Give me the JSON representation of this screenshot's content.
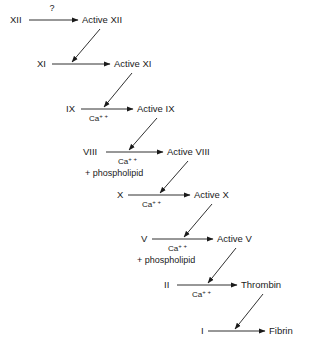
{
  "diagram": {
    "background_color": "#ffffff",
    "line_color": "#1a1a1a",
    "unknown_marker": "?",
    "cofactor_calcium": "Ca",
    "cofactor_calcium_charge": "+ +",
    "cofactor_phospholipid": "+ phospholipid",
    "steps": [
      {
        "id": "step-xii",
        "substrate": "XII",
        "product": "Active XII",
        "above_label": "?",
        "cofactor": null,
        "phospholipid": null,
        "substrate_x": 10,
        "substrate_y": 23,
        "line_x1": 29,
        "line_x2": 78,
        "product_x": 82,
        "product_y": 23,
        "line_y": 20,
        "above_label_x": 52,
        "above_label_y": 11
      },
      {
        "id": "step-xi",
        "substrate": "XI",
        "product": "Active XI",
        "above_label": null,
        "cofactor": null,
        "phospholipid": null,
        "substrate_x": 37,
        "substrate_y": 67,
        "line_x1": 52,
        "line_x2": 110,
        "product_x": 114,
        "product_y": 67,
        "line_y": 64
      },
      {
        "id": "step-ix",
        "substrate": "IX",
        "product": "Active IX",
        "above_label": null,
        "cofactor": "Ca",
        "phospholipid": null,
        "substrate_x": 66,
        "substrate_y": 112,
        "line_x1": 81,
        "line_x2": 133,
        "product_x": 137,
        "product_y": 112,
        "line_y": 109,
        "cofactor_x": 89,
        "cofactor_y": 121
      },
      {
        "id": "step-viii",
        "substrate": "VIII",
        "product": "Active VIII",
        "above_label": null,
        "cofactor": "Ca",
        "phospholipid": "+ phospholipid",
        "substrate_x": 83,
        "substrate_y": 155,
        "line_x1": 106,
        "line_x2": 163,
        "product_x": 167,
        "product_y": 155,
        "line_y": 152,
        "cofactor_x": 118,
        "cofactor_y": 164,
        "phospholipid_x": 85,
        "phospholipid_y": 176
      },
      {
        "id": "step-x",
        "substrate": "X",
        "product": "Active X",
        "above_label": null,
        "cofactor": "Ca",
        "phospholipid": null,
        "substrate_x": 117,
        "substrate_y": 198,
        "line_x1": 128,
        "line_x2": 190,
        "product_x": 194,
        "product_y": 198,
        "line_y": 195,
        "cofactor_x": 142,
        "cofactor_y": 207
      },
      {
        "id": "step-v",
        "substrate": "V",
        "product": "Active V",
        "above_label": null,
        "cofactor": "Ca",
        "phospholipid": "+ phospholipid",
        "substrate_x": 141,
        "substrate_y": 242,
        "line_x1": 152,
        "line_x2": 213,
        "product_x": 217,
        "product_y": 242,
        "line_y": 239,
        "cofactor_x": 168,
        "cofactor_y": 251,
        "phospholipid_x": 137,
        "phospholipid_y": 263
      },
      {
        "id": "step-ii",
        "substrate": "II",
        "product": "Thrombin",
        "above_label": null,
        "cofactor": "Ca",
        "phospholipid": null,
        "substrate_x": 164,
        "substrate_y": 288,
        "line_x1": 177,
        "line_x2": 237,
        "product_x": 241,
        "product_y": 288,
        "line_y": 285,
        "cofactor_x": 192,
        "cofactor_y": 297
      },
      {
        "id": "step-i",
        "substrate": "I",
        "product": "Fibrin",
        "above_label": null,
        "cofactor": null,
        "phospholipid": null,
        "substrate_x": 201,
        "substrate_y": 334,
        "line_x1": 208,
        "line_x2": 265,
        "product_x": 269,
        "product_y": 334,
        "line_y": 331
      }
    ],
    "activations": [
      {
        "id": "activation-xii-to-xi",
        "from": "Active XII",
        "to": "XI reaction",
        "x1": 100,
        "y1": 29,
        "x2": 72,
        "y2": 62
      },
      {
        "id": "activation-xi-to-ix",
        "from": "Active XI",
        "to": "IX reaction",
        "x1": 132,
        "y1": 73,
        "x2": 104,
        "y2": 107
      },
      {
        "id": "activation-ix-to-viii",
        "from": "Active IX",
        "to": "VIII reaction",
        "x1": 157,
        "y1": 118,
        "x2": 129,
        "y2": 150
      },
      {
        "id": "activation-viii-to-x",
        "from": "Active VIII",
        "to": "X reaction",
        "x1": 188,
        "y1": 161,
        "x2": 160,
        "y2": 193
      },
      {
        "id": "activation-x-to-v",
        "from": "Active X",
        "to": "V reaction",
        "x1": 212,
        "y1": 204,
        "x2": 184,
        "y2": 237
      },
      {
        "id": "activation-v-to-ii",
        "from": "Active V",
        "to": "II reaction",
        "x1": 236,
        "y1": 248,
        "x2": 208,
        "y2": 283
      },
      {
        "id": "activation-thrombin-to-i",
        "from": "Thrombin",
        "to": "I reaction",
        "x1": 263,
        "y1": 294,
        "x2": 235,
        "y2": 329
      }
    ]
  }
}
